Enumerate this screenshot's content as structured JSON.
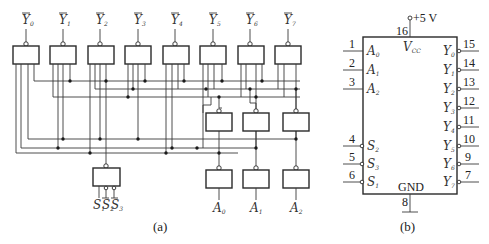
{
  "figure_a": {
    "caption": "(a)",
    "outputs": [
      {
        "name": "Y",
        "sub": "0"
      },
      {
        "name": "Y",
        "sub": "1"
      },
      {
        "name": "Y",
        "sub": "2"
      },
      {
        "name": "Y",
        "sub": "3"
      },
      {
        "name": "Y",
        "sub": "4"
      },
      {
        "name": "Y",
        "sub": "5"
      },
      {
        "name": "Y",
        "sub": "6"
      },
      {
        "name": "Y",
        "sub": "7"
      }
    ],
    "address_inputs": [
      {
        "name": "A",
        "sub": "0"
      },
      {
        "name": "A",
        "sub": "1"
      },
      {
        "name": "A",
        "sub": "2"
      }
    ],
    "enable_inputs": [
      {
        "name": "S",
        "sub": "1"
      },
      {
        "name": "S",
        "sub": "2"
      },
      {
        "name": "S",
        "sub": "3"
      }
    ]
  },
  "figure_b": {
    "caption": "(b)",
    "supply_label": "+5 V",
    "vcc_label": "V",
    "vcc_sub": "CC",
    "gnd_label": "GND",
    "vcc_pin": "16",
    "gnd_pin": "8",
    "left_pins": [
      {
        "pin": "1",
        "name": "A",
        "sub": "0"
      },
      {
        "pin": "2",
        "name": "A",
        "sub": "1"
      },
      {
        "pin": "3",
        "name": "A",
        "sub": "2"
      },
      {
        "pin": "4",
        "name": "S",
        "sub": "2"
      },
      {
        "pin": "5",
        "name": "S",
        "sub": "3"
      },
      {
        "pin": "6",
        "name": "S",
        "sub": "1"
      }
    ],
    "right_pins": [
      {
        "pin": "15",
        "name": "Y",
        "sub": "0"
      },
      {
        "pin": "14",
        "name": "Y",
        "sub": "1"
      },
      {
        "pin": "13",
        "name": "Y",
        "sub": "2"
      },
      {
        "pin": "12",
        "name": "Y",
        "sub": "3"
      },
      {
        "pin": "11",
        "name": "Y",
        "sub": "4"
      },
      {
        "pin": "10",
        "name": "Y",
        "sub": "5"
      },
      {
        "pin": "9",
        "name": "Y",
        "sub": "6"
      },
      {
        "pin": "7",
        "name": "Y",
        "sub": "7"
      }
    ]
  }
}
